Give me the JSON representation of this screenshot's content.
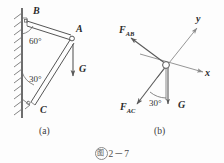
{
  "figure": {
    "caption_badge": "图",
    "caption_number": "2－7",
    "panels": [
      {
        "id": "a",
        "label": "(a)"
      },
      {
        "id": "b",
        "label": "(b)"
      }
    ]
  },
  "panel_a": {
    "name": "wall-bracket-assembly",
    "points": [
      {
        "name": "B",
        "label": "B",
        "x": 38,
        "y": 16,
        "desc": "upper wall pin"
      },
      {
        "name": "A",
        "label": "A",
        "x": 72,
        "y": 37,
        "desc": "apex joint"
      },
      {
        "name": "C",
        "label": "C",
        "x": 40,
        "y": 106,
        "desc": "lower wall pin"
      }
    ],
    "angles": [
      {
        "value": "60°",
        "at": "B",
        "x": 29,
        "y": 41
      },
      {
        "value": "30°",
        "at": "C",
        "x": 29,
        "y": 80
      }
    ],
    "load": {
      "symbol": "G",
      "x": 80,
      "y": 72,
      "direction": "down"
    },
    "members": [
      {
        "from": "B",
        "to": "A",
        "style": "double-bar"
      },
      {
        "from": "C",
        "to": "A",
        "style": "double-bar"
      }
    ],
    "support": "hatched-vertical-wall"
  },
  "panel_b": {
    "name": "free-body-diagram-at-A",
    "joint": {
      "label": "A",
      "x": 166,
      "y": 65
    },
    "axes": [
      {
        "name": "y",
        "label": "y",
        "x": 199,
        "y": 22
      },
      {
        "name": "x",
        "label": "x",
        "x": 207,
        "y": 73
      }
    ],
    "forces": [
      {
        "symbol": "F",
        "subscript": "AB",
        "label_x": 123,
        "label_y": 31,
        "direction": "up-left"
      },
      {
        "symbol": "F",
        "subscript": "AC",
        "label_x": 124,
        "label_y": 108,
        "direction": "down-left"
      },
      {
        "symbol": "G",
        "subscript": "",
        "label_x": 186,
        "label_y": 106,
        "direction": "down"
      }
    ],
    "angle": {
      "value": "30°",
      "x": 154,
      "y": 103
    }
  },
  "colors": {
    "background": "#fdfdfd",
    "line": "#555555",
    "wall": "#4a4a4a",
    "hatch": "#767676",
    "axis": "#8a8a8a",
    "text": "#2b2b2b"
  }
}
